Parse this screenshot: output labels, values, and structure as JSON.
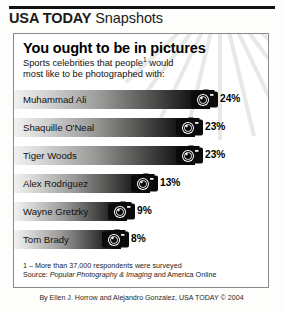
{
  "brand": {
    "name_bold": "USA TODAY",
    "name_rest": " Snapshots"
  },
  "panel": {
    "headline": "You ought to be in pictures",
    "subhead_line1": "Sports celebrities that people",
    "subhead_footnote_marker": "1",
    "subhead_line1_end": " would",
    "subhead_line2": "most like to be photographed with:",
    "footnote": "1 – More than 37,000 respondents were surveyed",
    "source_prefix": "Source: ",
    "source_italic": "Popular Photography & Imaging",
    "source_suffix": " and America Online"
  },
  "byline": "By Ellen J. Horrow and Alejandro Gonzalez, USA TODAY © 2004",
  "colors": {
    "rule": "#111111",
    "panel_border": "#8a8a86",
    "bar_dark": "#050505",
    "bar_light": "#f2f2f0",
    "page_bg": "#fdfdfb"
  },
  "chart_data": {
    "type": "bar",
    "title": "You ought to be in pictures",
    "subtitle": "Sports celebrities that people¹ would most like to be photographed with:",
    "xlabel": "",
    "ylabel": "",
    "orientation": "horizontal",
    "grid": false,
    "legend": false,
    "value_suffix": "%",
    "xlim": [
      0,
      25
    ],
    "categories": [
      "Muhammad Ali",
      "Shaquille O'Neal",
      "Tiger Woods",
      "Alex Rodriguez",
      "Wayne Gretzky",
      "Tom Brady"
    ],
    "values": [
      24,
      23,
      23,
      13,
      9,
      8
    ],
    "value_labels": [
      "24%",
      "23%",
      "23%",
      "13%",
      "9%",
      "8%"
    ],
    "bar_pixel_widths": [
      196,
      181,
      181,
      136,
      113,
      107
    ],
    "marker_icon": "camera-icon",
    "source": "Popular Photography & Imaging and America Online",
    "note": "1 – More than 37,000 respondents were surveyed"
  }
}
